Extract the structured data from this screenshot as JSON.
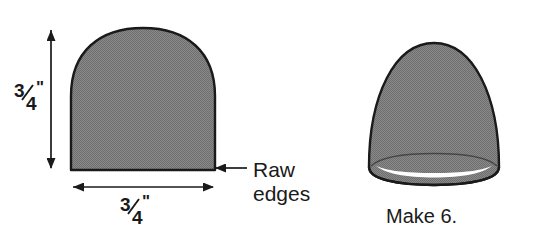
{
  "diagram": {
    "background_color": "#ffffff",
    "fill_color": "#808080",
    "outline_color": "#1a1a1a",
    "text_color": "#1a1a1a"
  },
  "flat_piece": {
    "name": "flat-pattern-piece",
    "height_label": {
      "numerator": "3",
      "denominator": "4",
      "unit": "\"",
      "full": "3/4\""
    },
    "width_label": {
      "numerator": "3",
      "denominator": "4",
      "unit": "\"",
      "full": "3/4\""
    }
  },
  "callout": {
    "name": "raw-edges-callout",
    "line1": "Raw",
    "line2": "edges",
    "full": "Raw edges"
  },
  "assembled_piece": {
    "name": "assembled-dome-piece",
    "caption": "Make 6."
  }
}
